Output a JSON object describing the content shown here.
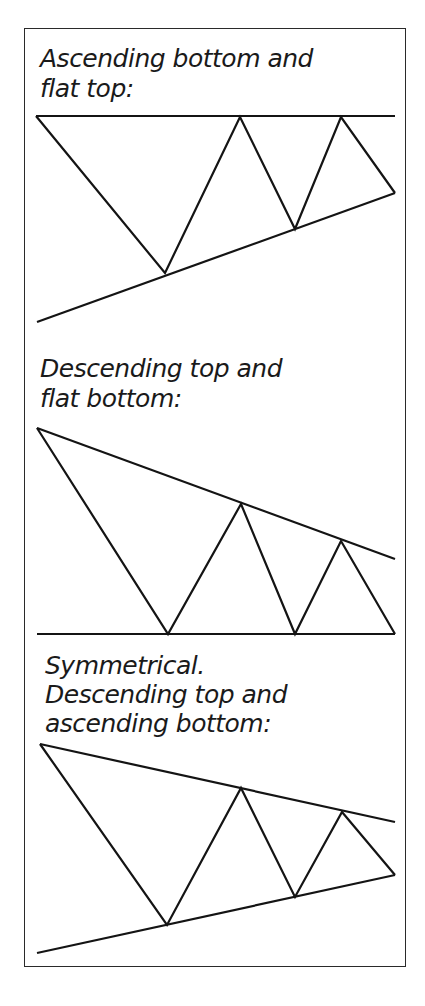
{
  "panels": [
    {
      "title_line1": "Ascending bottom and",
      "title_line2": "flat top:",
      "pattern": "ascending-triangle"
    },
    {
      "title_line1": "Descending top and",
      "title_line2": "flat bottom:",
      "pattern": "descending-triangle"
    },
    {
      "title_line1": "Symmetrical.",
      "title_line2": "Descending top and",
      "title_line3": "ascending bottom:",
      "pattern": "symmetrical-triangle"
    }
  ],
  "colors": {
    "line": "#141414",
    "background": "#ffffff"
  }
}
